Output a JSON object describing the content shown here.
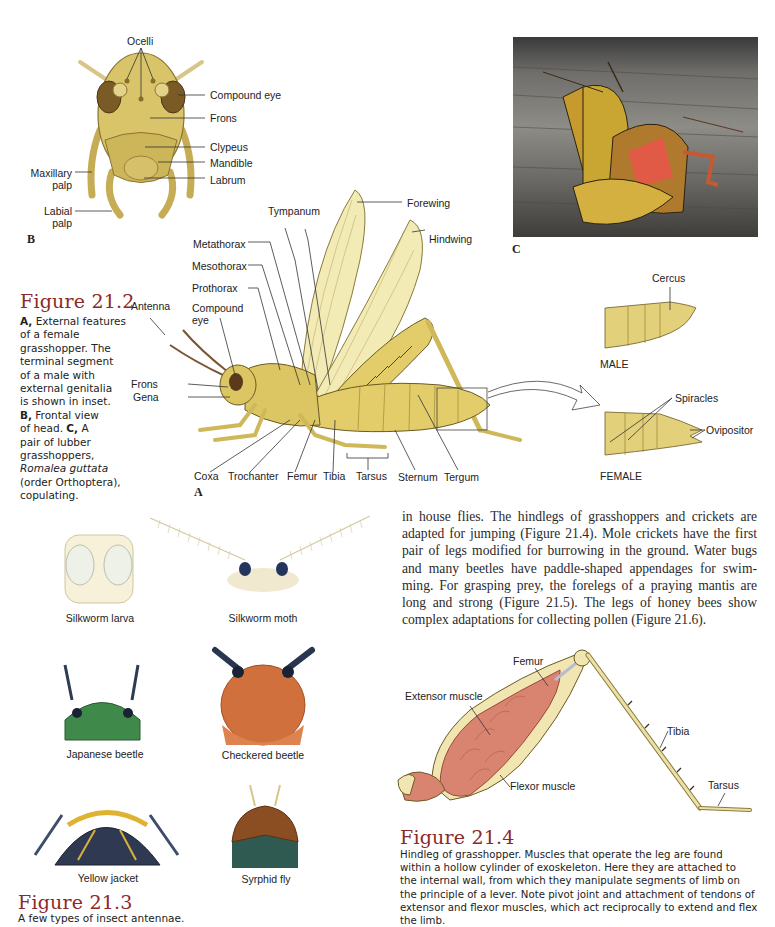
{
  "figure_21_2": {
    "title": "Figure 21.2",
    "caption": {
      "a_marker": "A,",
      "a_text": "External features of a female grasshopper. The terminal segment of a male with external genitalia is shown in inset.",
      "b_marker": "B,",
      "b_text": "Frontal view of head.",
      "c_marker": "C,",
      "c_text_1": "A pair of lubber grasshoppers,",
      "c_species": "Romalea guttata",
      "c_text_2": "(order Orthoptera), copulating."
    },
    "caption_lines": [
      "A, External features",
      "of a female",
      "grasshopper. The",
      "terminal segment",
      "of a male with",
      "external genitalia",
      "is shown in inset.",
      "B, Frontal view",
      "of head. C, A",
      "pair of lubber",
      "grasshoppers,",
      "Romalea guttata",
      "(order Orthoptera),",
      "copulating."
    ],
    "panel_b": {
      "letter": "B",
      "labels": {
        "ocelli": "Ocelli",
        "compound_eye": "Compound eye",
        "frons": "Frons",
        "clypeus": "Clypeus",
        "mandible": "Mandible",
        "labrum": "Labrum",
        "maxillary_palp_1": "Maxillary",
        "maxillary_palp_2": "palp",
        "labial_palp_1": "Labial",
        "labial_palp_2": "palp"
      }
    },
    "panel_a": {
      "letter": "A",
      "labels": {
        "tympanum": "Tympanum",
        "forewing": "Forewing",
        "hindwing": "Hindwing",
        "metathorax": "Metathorax",
        "mesothorax": "Mesothorax",
        "prothorax": "Prothorax",
        "antenna": "Antenna",
        "compound_eye_1": "Compound",
        "compound_eye_2": "eye",
        "frons": "Frons",
        "gena": "Gena",
        "coxa": "Coxa",
        "trochanter": "Trochanter",
        "femur": "Femur",
        "tibia": "Tibia",
        "tarsus": "Tarsus",
        "sternum": "Sternum",
        "tergum": "Tergum"
      }
    },
    "panel_c": {
      "letter": "C"
    },
    "inset": {
      "male_label": "MALE",
      "female_label": "FEMALE",
      "cercus": "Cercus",
      "spiracles": "Spiracles",
      "ovipositor": "Ovipositor"
    }
  },
  "figure_21_3": {
    "title": "Figure 21.3",
    "caption": "A few types of insect antennae.",
    "specimens": [
      {
        "name": "Silkworm larva"
      },
      {
        "name": "Silkworm moth"
      },
      {
        "name": "Japanese beetle"
      },
      {
        "name": "Checkered beetle"
      },
      {
        "name": "Yellow jacket"
      },
      {
        "name": "Syrphid fly"
      }
    ]
  },
  "body_text": {
    "lines": [
      "in house flies. The hindlegs of grasshoppers and crickets are",
      "adapted for jumping (Figure 21.4). Mole crickets have the first",
      "pair of legs modified for burrowing in the ground. Water bugs",
      "and many beetles have paddle-shaped appendages for swim-",
      "ming. For grasping prey, the forelegs of a praying mantis are",
      "long and strong (Figure 21.5). The legs of honey bees show",
      "complex adaptations for collecting pollen (Figure 21.6)."
    ]
  },
  "figure_21_4": {
    "title": "Figure 21.4",
    "labels": {
      "femur": "Femur",
      "extensor_muscle": "Extensor muscle",
      "flexor_muscle": "Flexor muscle",
      "tibia": "Tibia",
      "tarsus": "Tarsus"
    },
    "caption_lines": [
      "Hindleg of grasshopper. Muscles that operate the leg are found",
      "within a hollow cylinder of exoskeleton. Here they are attached to",
      "the internal wall, from which they manipulate segments of limb on",
      "the principle of a lever. Note pivot joint and attachment of tendons of",
      "extensor and flexor muscles, which act reciprocally to extend and flex",
      "the limb."
    ]
  },
  "colors": {
    "figure_title": "#8b2a2a",
    "insect_body": "#d9c46a",
    "insect_shade": "#a8923a",
    "wing": "#f3ebb6",
    "muscle": "#d98470"
  }
}
